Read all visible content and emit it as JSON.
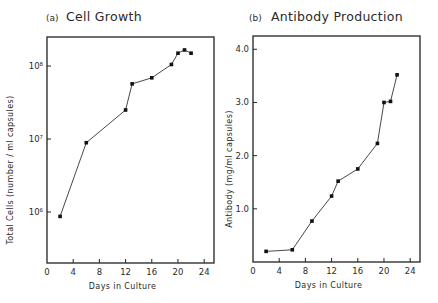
{
  "chart_data": [
    {
      "id": "a",
      "type": "line",
      "panel_tag": "(a)",
      "title": "Cell Growth",
      "xlabel": "Days in Culture",
      "ylabel": "Total Cells (number / ml capsules)",
      "yscale": "log",
      "xlim": [
        0,
        25.5
      ],
      "xticks": [
        0,
        4,
        8,
        12,
        16,
        20,
        24
      ],
      "xtick_labels": [
        "0",
        "4",
        "8",
        "12",
        "16",
        "20",
        "24"
      ],
      "ylim": [
        200000,
        250000000
      ],
      "yticks": [
        1000000,
        10000000,
        100000000
      ],
      "ytick_labels": [
        "10⁶",
        "10⁷",
        "10⁸"
      ],
      "grid": false,
      "legend": null,
      "x": [
        2,
        6,
        12,
        13,
        16,
        19,
        20,
        21,
        22
      ],
      "y": [
        870000,
        8900000,
        25000000,
        57000000,
        69000000,
        105000000,
        150000000,
        166000000,
        150000000
      ]
    },
    {
      "id": "b",
      "type": "line",
      "panel_tag": "(b)",
      "title": "Antibody Production",
      "xlabel": "Days in Culture",
      "ylabel": "Antibody (mg/ml capsules)",
      "yscale": "linear",
      "xlim": [
        0,
        25.5
      ],
      "xticks": [
        0,
        4,
        8,
        12,
        16,
        20,
        24
      ],
      "xtick_labels": [
        "0",
        "4",
        "8",
        "12",
        "16",
        "20",
        "24"
      ],
      "ylim": [
        0,
        4.25
      ],
      "yticks": [
        1.0,
        2.0,
        3.0,
        4.0
      ],
      "ytick_labels": [
        "1.0",
        "2.0",
        "3.0",
        "4.0"
      ],
      "grid": false,
      "legend": null,
      "x": [
        2,
        6,
        9,
        12,
        13,
        16,
        19,
        20,
        21,
        22
      ],
      "y": [
        0.2,
        0.23,
        0.77,
        1.24,
        1.52,
        1.75,
        2.23,
        3.0,
        3.02,
        3.52
      ]
    }
  ],
  "layout": {
    "panels": [
      {
        "frame": {
          "x0": 47,
          "x1": 214,
          "y0": 37,
          "y1": 263
        },
        "title_x": 46,
        "title_y": 21,
        "title_text_x": 66,
        "ylabel_x": 13
      },
      {
        "frame": {
          "x0": 253,
          "x1": 420,
          "y0": 36,
          "y1": 262
        },
        "title_x": 249,
        "title_y": 21,
        "title_text_x": 271,
        "ylabel_x": 232
      }
    ]
  }
}
